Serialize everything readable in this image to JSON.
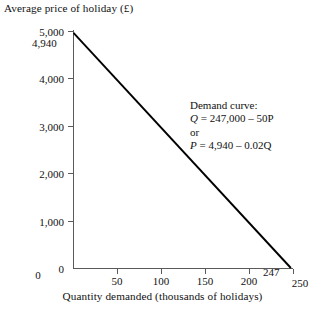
{
  "chart_data": {
    "type": "line",
    "title": "",
    "ylabel": "Average price of holiday (£)",
    "xlabel": "Quantity demanded (thousands of holidays)",
    "xlim": [
      0,
      250
    ],
    "ylim": [
      0,
      5000
    ],
    "grid": false,
    "legend": "none",
    "x_ticks": [
      "0",
      "50",
      "100",
      "150",
      "200",
      "250"
    ],
    "x_tick_values": [
      0,
      50,
      100,
      150,
      200,
      250
    ],
    "y_ticks": [
      "0",
      "1,000",
      "2,000",
      "3,000",
      "4,000",
      "5,000"
    ],
    "y_tick_values": [
      0,
      1000,
      2000,
      3000,
      4000,
      5000
    ],
    "series": [
      {
        "name": "Demand curve",
        "x": [
          0,
          247
        ],
        "y": [
          4940,
          0
        ],
        "color": "#000000"
      }
    ],
    "intercepts": {
      "y_intercept_label": "4,940",
      "y_intercept_value": 4940,
      "x_intercept_label": "247",
      "x_intercept_value": 247
    },
    "annotations": [
      {
        "title": "Demand curve:",
        "line_q_var": "Q",
        "line_q_expr": " = 247,000 – 50P",
        "connector": "or",
        "line_p_var": "P",
        "line_p_expr": " = 4,940 – 0.02Q"
      }
    ]
  },
  "colors": {
    "curve": "#000000",
    "axis": "#5a5a5a",
    "text": "#111111",
    "background": "#ffffff"
  }
}
